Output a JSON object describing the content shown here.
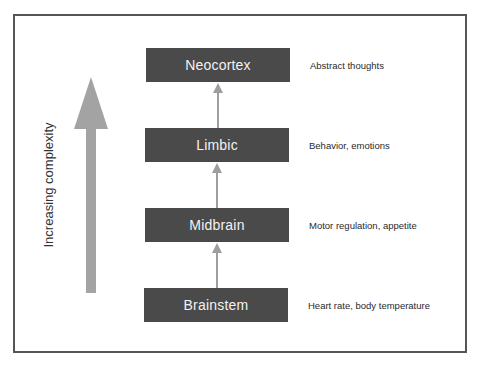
{
  "diagram": {
    "side_label": "Increasing complexity",
    "levels": [
      {
        "name": "Neocortex",
        "description": "Abstract thoughts"
      },
      {
        "name": "Limbic",
        "description": "Behavior, emotions"
      },
      {
        "name": "Midbrain",
        "description": "Motor regulation, appetite"
      },
      {
        "name": "Brainstem",
        "description": "Heart rate, body temperature"
      }
    ],
    "colors": {
      "box_fill": "#4a4a4a",
      "box_text": "#f2f2f2",
      "arrow": "#9e9e9e",
      "frame": "#555555"
    }
  }
}
